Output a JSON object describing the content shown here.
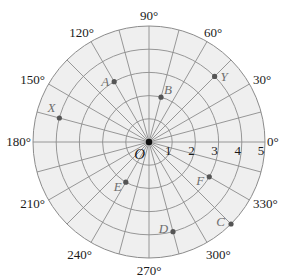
{
  "diagram": {
    "type": "polar-grid",
    "center_px": [
      149,
      142
    ],
    "radius_px": 116,
    "max_radius_units": 5,
    "ray_step_degrees": 15,
    "colors": {
      "background": "#ffffff",
      "disc_fill": "#efefef",
      "grid_line": "#8c8c8c",
      "point_fill": "#555555",
      "point_label": "#6e6e6e",
      "text": "#1a1a1a"
    },
    "origin": {
      "label": "O"
    },
    "radius_labels": [
      "1",
      "2",
      "3",
      "4",
      "5"
    ],
    "angle_labels": [
      {
        "angle": 0,
        "text": "0°"
      },
      {
        "angle": 30,
        "text": "30°"
      },
      {
        "angle": 60,
        "text": "60°"
      },
      {
        "angle": 90,
        "text": "90°"
      },
      {
        "angle": 120,
        "text": "120°"
      },
      {
        "angle": 150,
        "text": "150°"
      },
      {
        "angle": 180,
        "text": "180°"
      },
      {
        "angle": 210,
        "text": "210°"
      },
      {
        "angle": 240,
        "text": "240°"
      },
      {
        "angle": 270,
        "text": "270°"
      },
      {
        "angle": 300,
        "text": "300°"
      },
      {
        "angle": 330,
        "text": "330°"
      }
    ],
    "points": [
      {
        "label": "A",
        "r": 3,
        "theta": 120
      },
      {
        "label": "B",
        "r": 2,
        "theta": 75
      },
      {
        "label": "C",
        "r": 5,
        "theta": 315
      },
      {
        "label": "D",
        "r": 4,
        "theta": 285
      },
      {
        "label": "E",
        "r": 2,
        "theta": 240
      },
      {
        "label": "F",
        "r": 3,
        "theta": 330
      },
      {
        "label": "X",
        "r": 4,
        "theta": 165
      },
      {
        "label": "Y",
        "r": 4,
        "theta": 45
      }
    ]
  }
}
